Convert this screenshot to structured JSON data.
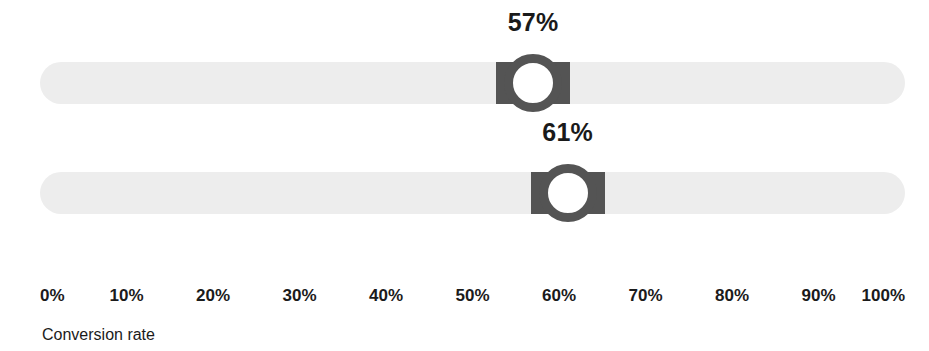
{
  "chart_data": {
    "type": "bar",
    "title": "",
    "xlabel": "Conversion rate",
    "ylabel": "",
    "xlim": [
      0,
      100
    ],
    "grid": false,
    "legend": "none",
    "categories": [
      "slider-1",
      "slider-2"
    ],
    "values": [
      57,
      61
    ],
    "tick_labels": [
      "0%",
      "10%",
      "20%",
      "30%",
      "40%",
      "50%",
      "60%",
      "70%",
      "80%",
      "90%",
      "100%"
    ],
    "tick_values": [
      0,
      10,
      20,
      30,
      40,
      50,
      60,
      70,
      80,
      90,
      100
    ],
    "data_labels": [
      "57%",
      "61%"
    ]
  },
  "colors": {
    "track": "#ededed",
    "thumb": "#545454",
    "thumb_center": "#ffffff",
    "text": "#1b1b1b",
    "background": "#ffffff"
  },
  "sliders": [
    {
      "id": "slider-1",
      "value": 57,
      "value_label": "57%",
      "min": 0,
      "max": 100,
      "min_label": "0%",
      "max_label": "100%"
    },
    {
      "id": "slider-2",
      "value": 61,
      "value_label": "61%",
      "min": 0,
      "max": 100,
      "min_label": "0%",
      "max_label": "100%"
    }
  ],
  "axis": {
    "title": "Conversion rate",
    "ticks": [
      "0%",
      "10%",
      "20%",
      "30%",
      "40%",
      "50%",
      "60%",
      "70%",
      "80%",
      "90%",
      "100%"
    ]
  }
}
